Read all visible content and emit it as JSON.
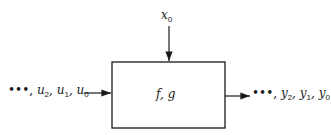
{
  "diagram": {
    "type": "block-diagram",
    "block": {
      "label": "f, g"
    },
    "top_input": {
      "label": "x",
      "subscript": "0"
    },
    "inputs": {
      "prefix": "•••, ",
      "items": [
        {
          "label": "u",
          "subscript": "2"
        },
        {
          "label": "u",
          "subscript": "1"
        },
        {
          "label": "u",
          "subscript": "0"
        }
      ]
    },
    "outputs": {
      "prefix": "•••, ",
      "items": [
        {
          "label": "y",
          "subscript": "2"
        },
        {
          "label": "y",
          "subscript": "1"
        },
        {
          "label": "y",
          "subscript": "0"
        }
      ]
    }
  }
}
